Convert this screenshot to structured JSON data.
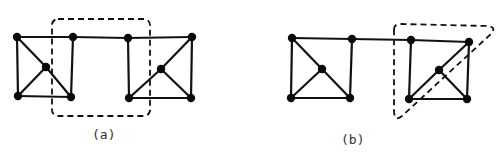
{
  "figures": [
    {
      "id": "a",
      "label": "(a)",
      "nodes": [
        {
          "id": "a1",
          "x": 17,
          "y": 37
        },
        {
          "id": "a2",
          "x": 73,
          "y": 37
        },
        {
          "id": "a3",
          "x": 18,
          "y": 96
        },
        {
          "id": "a4",
          "x": 71,
          "y": 97
        },
        {
          "id": "a5",
          "x": 46,
          "y": 67
        },
        {
          "id": "a6",
          "x": 128,
          "y": 38
        },
        {
          "id": "a7",
          "x": 192,
          "y": 37
        },
        {
          "id": "a8",
          "x": 129,
          "y": 98
        },
        {
          "id": "a9",
          "x": 191,
          "y": 98
        },
        {
          "id": "a10",
          "x": 161,
          "y": 69
        }
      ],
      "edges": [
        [
          "a1",
          "a2"
        ],
        [
          "a1",
          "a3"
        ],
        [
          "a2",
          "a4"
        ],
        [
          "a3",
          "a4"
        ],
        [
          "a1",
          "a5"
        ],
        [
          "a5",
          "a4"
        ],
        [
          "a5",
          "a3"
        ],
        [
          "a2",
          "a6"
        ],
        [
          "a6",
          "a7"
        ],
        [
          "a6",
          "a8"
        ],
        [
          "a7",
          "a9"
        ],
        [
          "a8",
          "a9"
        ],
        [
          "a8",
          "a10"
        ],
        [
          "a10",
          "a7"
        ],
        [
          "a10",
          "a9"
        ]
      ],
      "highlight": {
        "shape": "rounded-rect",
        "style": "dashed",
        "x": 52,
        "y": 19,
        "width": 98,
        "height": 97,
        "rx": 6
      }
    },
    {
      "id": "b",
      "label": "(b)",
      "nodes": [
        {
          "id": "b1",
          "x": 292,
          "y": 38
        },
        {
          "id": "b2",
          "x": 352,
          "y": 39
        },
        {
          "id": "b3",
          "x": 291,
          "y": 98
        },
        {
          "id": "b4",
          "x": 350,
          "y": 98
        },
        {
          "id": "b5",
          "x": 322,
          "y": 69
        },
        {
          "id": "b6",
          "x": 411,
          "y": 40
        },
        {
          "id": "b7",
          "x": 469,
          "y": 42
        },
        {
          "id": "b8",
          "x": 409,
          "y": 99
        },
        {
          "id": "b9",
          "x": 467,
          "y": 99
        },
        {
          "id": "b10",
          "x": 439,
          "y": 70
        }
      ],
      "edges": [
        [
          "b1",
          "b2"
        ],
        [
          "b1",
          "b3"
        ],
        [
          "b2",
          "b4"
        ],
        [
          "b3",
          "b4"
        ],
        [
          "b1",
          "b5"
        ],
        [
          "b5",
          "b4"
        ],
        [
          "b5",
          "b3"
        ],
        [
          "b2",
          "b6"
        ],
        [
          "b6",
          "b7"
        ],
        [
          "b6",
          "b8"
        ],
        [
          "b7",
          "b9"
        ],
        [
          "b8",
          "b9"
        ],
        [
          "b8",
          "b10"
        ],
        [
          "b10",
          "b7"
        ],
        [
          "b10",
          "b9"
        ]
      ],
      "highlight": {
        "shape": "rounded-triangle",
        "style": "dashed",
        "path": "M 394 30 Q 394 24 400 24 L 488 26 Q 496 27 492 33 L 402 116 Q 395 122 394 112 Z"
      }
    }
  ],
  "colors": {
    "stroke": "#111111",
    "node": "#0a0a0a",
    "background": "#ffffff",
    "label": "#333333"
  }
}
